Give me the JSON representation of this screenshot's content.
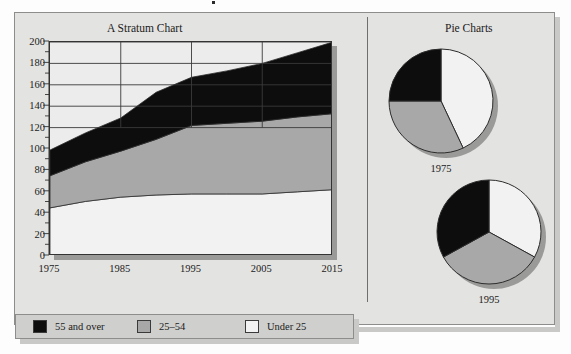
{
  "figure": {
    "stratum_title": "A Stratum Chart",
    "pie_title": "Pie Charts"
  },
  "legend": {
    "entries": [
      {
        "label": "55 and over",
        "color": "#0d0d0d"
      },
      {
        "label": "25–54",
        "color": "#a8a8a8"
      },
      {
        "label": "Under 25",
        "color": "#f2f2f2"
      }
    ]
  },
  "palette": {
    "panel_background": "#e3e3e1",
    "plot_background": "#ececec",
    "series_55_over": "#0d0d0d",
    "series_25_54": "#a8a8a8",
    "series_under_25": "#f2f2f2",
    "axis": "#333333",
    "gridline": "#3a3a3a",
    "shadow": "#9a9a98",
    "frame_border": "#8d8d8b",
    "text": "#1b1b1b"
  },
  "chart_data": [
    {
      "type": "area",
      "title": "A Stratum Chart",
      "xlabel": "",
      "ylabel": "",
      "stacked": true,
      "grid": true,
      "legend_position": "bottom",
      "xlim": [
        1975,
        2015
      ],
      "ylim": [
        0,
        200
      ],
      "yticks": [
        0,
        20,
        40,
        60,
        80,
        100,
        120,
        140,
        160,
        180,
        200
      ],
      "ytick_labels": [
        "0",
        "20",
        "40",
        "60",
        "80",
        "100",
        "120",
        "140",
        "160",
        "180",
        "200"
      ],
      "y_minor_tick_step": 10,
      "xticks": [
        1975,
        1985,
        1995,
        2005,
        2015
      ],
      "xtick_labels": [
        "1975",
        "1985",
        "1995",
        "2005",
        "2015"
      ],
      "x": [
        1975,
        1980,
        1985,
        1990,
        1995,
        2000,
        2005,
        2010,
        2015
      ],
      "series": [
        {
          "name": "Under 25",
          "color": "#f2f2f2",
          "values": [
            45,
            51,
            55,
            57,
            58,
            58,
            58,
            60,
            62
          ]
        },
        {
          "name": "25-54",
          "color": "#a8a8a8",
          "values": [
            30,
            37,
            43,
            52,
            64,
            66,
            68,
            70,
            71
          ]
        },
        {
          "name": "55 and over",
          "color": "#0d0d0d",
          "values": [
            24,
            27,
            31,
            44,
            45,
            49,
            54,
            60,
            67
          ]
        }
      ],
      "cumulative_totals": [
        99,
        115,
        129,
        153,
        167,
        173,
        180,
        190,
        200
      ]
    },
    {
      "type": "pie",
      "title": "1975",
      "labels": [
        "55 and over",
        "25-54",
        "Under 25"
      ],
      "values": [
        25,
        32,
        43
      ],
      "colors": [
        "#0d0d0d",
        "#a8a8a8",
        "#f2f2f2"
      ],
      "legend_position": "bottom"
    },
    {
      "type": "pie",
      "title": "1995",
      "labels": [
        "55 and over",
        "25-54",
        "Under 25"
      ],
      "values": [
        33,
        34,
        33
      ],
      "colors": [
        "#0d0d0d",
        "#a8a8a8",
        "#f2f2f2"
      ],
      "legend_position": "bottom"
    }
  ],
  "pies": [
    {
      "year_label": "1975"
    },
    {
      "year_label": "1995"
    }
  ]
}
